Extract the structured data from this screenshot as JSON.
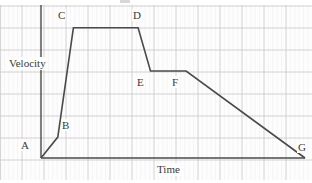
{
  "chart_data": {
    "type": "line",
    "title": "",
    "xlabel": "Time",
    "ylabel": "Velocity",
    "grid": true,
    "legend": false,
    "xlim": [
      0,
      11.5
    ],
    "ylim": [
      0,
      5.9
    ],
    "annotations": [
      "A",
      "B",
      "C",
      "D",
      "E",
      "F",
      "G"
    ],
    "series": [
      {
        "name": "velocity",
        "points": [
          {
            "label": "A",
            "x": 0.0,
            "y": 0.0
          },
          {
            "label": "B",
            "x": 0.73,
            "y": 0.95
          },
          {
            "label": "C",
            "x": 1.41,
            "y": 5.91
          },
          {
            "label": "D",
            "x": 4.23,
            "y": 5.91
          },
          {
            "label": "E",
            "x": 4.77,
            "y": 3.95
          },
          {
            "label": "F",
            "x": 6.32,
            "y": 3.95
          },
          {
            "label": "G",
            "x": 11.5,
            "y": 0.0
          }
        ]
      }
    ]
  },
  "labels": {
    "velocity_axis": "Velocity",
    "time_axis": "Time",
    "A": "A",
    "B": "B",
    "C": "C",
    "D": "D",
    "E": "E",
    "F": "F",
    "G": "G"
  },
  "colors": {
    "curve": "#4a4a4a",
    "axis": "#4a4a4a",
    "grid_major": "#c6c6c6",
    "grid_minor": "#e8e8e8",
    "text": "#3a3a3a",
    "paper": "#fdfdfd"
  }
}
